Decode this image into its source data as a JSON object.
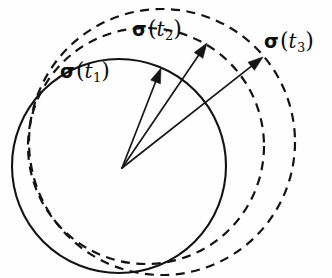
{
  "figure": {
    "background_color": "#fefefe",
    "ink_color": "#131313",
    "labels": [
      {
        "id": "t1",
        "symbol": "σ",
        "open_paren": "(",
        "variable": "t",
        "subscript": "1",
        "close_paren": ")",
        "text": "σ(t₁)"
      },
      {
        "id": "t2",
        "symbol": "σ",
        "open_paren": "(",
        "variable": "t",
        "subscript": "2",
        "close_paren": ")",
        "text": "σ(t₂)"
      },
      {
        "id": "t3",
        "symbol": "σ",
        "open_paren": "(",
        "variable": "t",
        "subscript": "3",
        "close_paren": ")",
        "text": "σ(t₃)"
      }
    ]
  },
  "chart_data": {
    "type": "diagram",
    "title": "",
    "origin": {
      "x": 122,
      "y": 168,
      "label": "common vector origin"
    },
    "circles": [
      {
        "name": "circle-t1",
        "style": "solid",
        "cx": 119,
        "cy": 166,
        "r": 107,
        "stroke": "#131313"
      },
      {
        "name": "circle-t2",
        "style": "dashed",
        "cx": 146,
        "cy": 146,
        "r": 118,
        "stroke": "#131313"
      },
      {
        "name": "circle-t3",
        "style": "dashed",
        "cx": 162,
        "cy": 142,
        "r": 133,
        "stroke": "#131313"
      }
    ],
    "vectors": [
      {
        "name": "vector-t1",
        "from": {
          "x": 122,
          "y": 168
        },
        "to": {
          "x": 161,
          "y": 68
        },
        "label": "σ(t₁)"
      },
      {
        "name": "vector-t2",
        "from": {
          "x": 122,
          "y": 168
        },
        "to": {
          "x": 207,
          "y": 43
        },
        "label": "σ(t₂)"
      },
      {
        "name": "vector-t3",
        "from": {
          "x": 122,
          "y": 168
        },
        "to": {
          "x": 263,
          "y": 57
        },
        "label": "σ(t₃)"
      }
    ],
    "axis_visible": false,
    "grid": false,
    "legend": null
  }
}
